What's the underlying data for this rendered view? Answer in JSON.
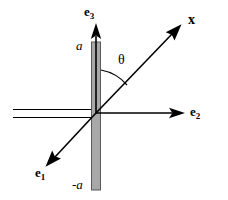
{
  "figure": {
    "background_color": "#ffffff",
    "stroke_color": "#000000",
    "plate": {
      "name": "vertical-plate",
      "fill_color": "#a8a8a8",
      "edge_color": "#555555",
      "top_label": "a",
      "bottom_label": "-a"
    },
    "labels": {
      "e3": "e",
      "e3_sub": "3",
      "e2": "e",
      "e2_sub": "2",
      "e1": "e",
      "e1_sub": "1",
      "x": "x",
      "theta": "θ",
      "a_top": "a",
      "a_bottom": "-a"
    },
    "vectors": [
      {
        "name": "e3-axis",
        "label": "e3",
        "direction": "up"
      },
      {
        "name": "e2-axis",
        "label": "e2",
        "direction": "right"
      },
      {
        "name": "e1-axis",
        "label": "e1",
        "direction": "down-left"
      },
      {
        "name": "x-direction",
        "label": "x",
        "direction": "up-right"
      }
    ],
    "angle": {
      "name": "theta-angle",
      "symbol": "θ",
      "between": [
        "e3-axis",
        "x-direction"
      ]
    },
    "incident_ray": {
      "name": "incident-ray-pair",
      "description": "two parallel horizontal lines entering from the left"
    }
  }
}
